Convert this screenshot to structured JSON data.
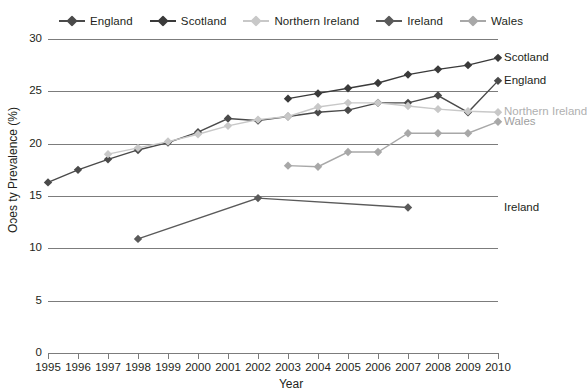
{
  "chart_data": {
    "type": "line",
    "title": "",
    "xlabel": "Year",
    "ylabel": "Oɔes ty Prevalence (%)",
    "ylabel_intended": "Obesity Prevalence (%)",
    "x": [
      1995,
      1996,
      1997,
      1998,
      1999,
      2000,
      2001,
      2002,
      2003,
      2004,
      2005,
      2006,
      2007,
      2008,
      2009,
      2010
    ],
    "categories": [
      "1995",
      "1996",
      "1997",
      "1998",
      "1999",
      "2000",
      "2001",
      "2002",
      "2003",
      "2004",
      "2005",
      "2006",
      "2007",
      "2008",
      "2009",
      "2010"
    ],
    "xlim": [
      1995,
      2010
    ],
    "ylim": [
      0,
      30
    ],
    "yticks": [
      0,
      5,
      10,
      15,
      20,
      25,
      30
    ],
    "grid": true,
    "legend_position": "top-center",
    "series": [
      {
        "name": "England",
        "color": "#4a4a4a",
        "x": [
          1995,
          1996,
          1997,
          1998,
          1999,
          2000,
          2001,
          2002,
          2003,
          2004,
          2005,
          2006,
          2007,
          2008,
          2009,
          2010
        ],
        "values": [
          16.3,
          17.5,
          18.5,
          19.4,
          20.1,
          21.1,
          22.4,
          22.2,
          22.6,
          23.0,
          23.2,
          23.9,
          23.9,
          24.6,
          23.0,
          26.0
        ]
      },
      {
        "name": "Scotland",
        "color": "#3a3a3a",
        "x": [
          2003,
          2004,
          2005,
          2006,
          2007,
          2008,
          2009,
          2010
        ],
        "values": [
          24.3,
          24.8,
          25.3,
          25.8,
          26.6,
          27.1,
          27.5,
          28.2
        ]
      },
      {
        "name": "Northern Ireland",
        "color": "#c8c8c8",
        "x": [
          1997,
          1998,
          1999,
          2000,
          2001,
          2002,
          2003,
          2004,
          2005,
          2006,
          2007,
          2008,
          2009,
          2010
        ],
        "values": [
          19.0,
          19.6,
          20.2,
          20.9,
          21.7,
          22.3,
          22.6,
          23.5,
          23.9,
          23.9,
          23.6,
          23.3,
          23.1,
          23.0
        ]
      },
      {
        "name": "Ireland",
        "color": "#5a5a5a",
        "x": [
          1998,
          2002,
          2007
        ],
        "values": [
          10.9,
          14.8,
          13.9
        ]
      },
      {
        "name": "Wales",
        "color": "#a8a8a8",
        "x": [
          2003,
          2004,
          2005,
          2006,
          2007,
          2008,
          2009,
          2010
        ],
        "values": [
          17.9,
          17.8,
          19.2,
          19.2,
          21.0,
          21.0,
          21.0,
          22.1
        ]
      }
    ],
    "legend": [
      {
        "label": "England",
        "color": "#4a4a4a"
      },
      {
        "label": "Scotland",
        "color": "#3a3a3a"
      },
      {
        "label": "Northern Ireland",
        "color": "#c8c8c8"
      },
      {
        "label": "Ireland",
        "color": "#5a5a5a"
      },
      {
        "label": "Wales",
        "color": "#a8a8a8"
      }
    ],
    "end_labels": [
      {
        "label": "Scotland",
        "value": 28.2,
        "color": "#231f20"
      },
      {
        "label": "England",
        "value": 26.0,
        "color": "#231f20"
      },
      {
        "label": "Northern Ireland",
        "value": 23.0,
        "color": "#b0b0b0"
      },
      {
        "label": "Wales",
        "value": 22.1,
        "color": "#a0a0a0"
      },
      {
        "label": "Ireland",
        "value": 13.9,
        "color": "#231f20"
      }
    ]
  }
}
